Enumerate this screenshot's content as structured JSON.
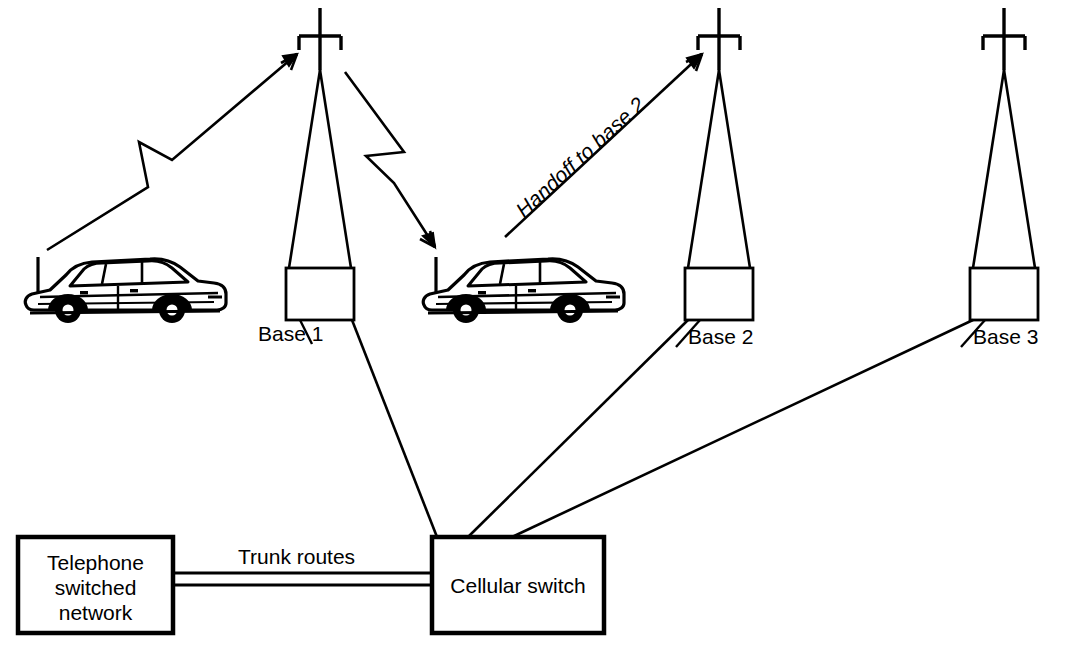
{
  "diagram": {
    "stroke_color": "#000000",
    "background_color": "#ffffff",
    "towers": [
      {
        "id": "base1",
        "label": "Base 1"
      },
      {
        "id": "base2",
        "label": "Base 2"
      },
      {
        "id": "base3",
        "label": "Base 3"
      }
    ],
    "boxes": {
      "telephone_network": {
        "label": "Telephone\nswitched\nnetwork",
        "line1": "Telephone",
        "line2": "switched",
        "line3": "network"
      },
      "cellular_switch": {
        "label": "Cellular switch"
      }
    },
    "links": {
      "trunk_routes": "Trunk routes",
      "handoff": "Handoff to base 2"
    },
    "vehicles": [
      {
        "id": "car-left",
        "name": "mobile-car-left"
      },
      {
        "id": "car-right",
        "name": "mobile-car-right"
      }
    ]
  }
}
